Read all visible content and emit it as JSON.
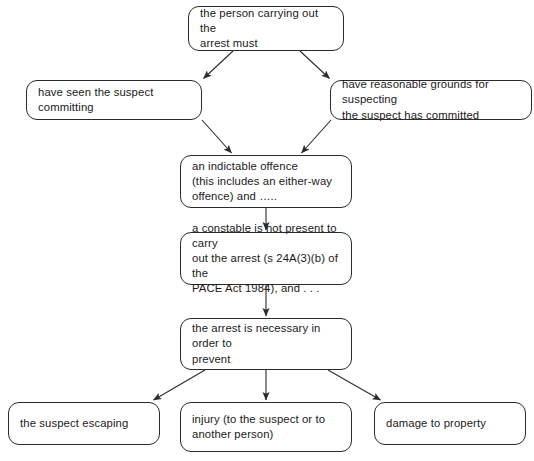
{
  "diagram": {
    "type": "flowchart",
    "background_color": "#ffffff",
    "line_color": "#2b2b2b",
    "text_color": "#1a1a1a",
    "nodes": [
      {
        "id": "person-carrying-out-arrest",
        "name": "node-person-carrying-out-arrest",
        "text": "the person carrying out the\narrest must",
        "x": 188,
        "y": 6,
        "width": 156,
        "height": 45
      },
      {
        "id": "have-seen-suspect-committing",
        "name": "node-have-seen-suspect-committing",
        "text": "have seen the suspect committing",
        "x": 26,
        "y": 80,
        "width": 176,
        "height": 40
      },
      {
        "id": "reasonable-grounds-suspecting",
        "name": "node-reasonable-grounds-suspecting",
        "text": "have reasonable grounds for suspecting\nthe suspect has committed",
        "x": 330,
        "y": 80,
        "width": 202,
        "height": 40
      },
      {
        "id": "indictable-offence",
        "name": "node-indictable-offence",
        "text": "an indictable offence\n(this includes an either-way\noffence) and …..",
        "x": 180,
        "y": 155,
        "width": 172,
        "height": 53
      },
      {
        "id": "constable-not-present",
        "name": "node-constable-not-present",
        "text": "a constable is not present to carry\nout the arrest (s 24A(3)(b) of the\nPACE Act 1984), and . . .",
        "x": 180,
        "y": 232,
        "width": 172,
        "height": 53
      },
      {
        "id": "arrest-necessary",
        "name": "node-arrest-necessary",
        "text": "the arrest is necessary in order to\nprevent",
        "x": 180,
        "y": 318,
        "width": 172,
        "height": 52
      },
      {
        "id": "suspect-escaping",
        "name": "node-suspect-escaping",
        "text": "the suspect escaping",
        "x": 8,
        "y": 402,
        "width": 152,
        "height": 43
      },
      {
        "id": "injury-to-suspect",
        "name": "node-injury-to-suspect",
        "text": "injury (to the suspect or to\nanother person)",
        "x": 180,
        "y": 402,
        "width": 172,
        "height": 50
      },
      {
        "id": "damage-to-property",
        "name": "node-damage-to-property",
        "text": "damage to property",
        "x": 374,
        "y": 402,
        "width": 152,
        "height": 43
      },
      {
        "id": "caption-diagram-title",
        "name": "diagram-title",
        "text": ""
      }
    ],
    "edges": [
      {
        "from": "person-carrying-out-arrest",
        "to": "have-seen-suspect-committing",
        "name": "edge-person-to-have-seen",
        "points": "233,51 202,80"
      },
      {
        "from": "person-carrying-out-arrest",
        "to": "reasonable-grounds-suspecting",
        "name": "edge-person-to-reasonable-grounds",
        "points": "300,51 331,80"
      },
      {
        "from": "have-seen-suspect-committing",
        "to": "indictable-offence",
        "name": "edge-have-seen-to-indictable",
        "points": "202,120 233,155"
      },
      {
        "from": "reasonable-grounds-suspecting",
        "to": "indictable-offence",
        "name": "edge-reasonable-grounds-to-indictable",
        "points": "331,120 300,155"
      },
      {
        "from": "indictable-offence",
        "to": "constable-not-present",
        "name": "edge-indictable-to-constable",
        "points": "266,208 266,232"
      },
      {
        "from": "constable-not-present",
        "to": "arrest-necessary",
        "name": "edge-constable-to-arrest-necessary",
        "points": "266,285 266,318"
      },
      {
        "from": "arrest-necessary",
        "to": "suspect-escaping",
        "name": "edge-arrest-necessary-to-escaping",
        "points": "205,370 152,402"
      },
      {
        "from": "arrest-necessary",
        "to": "injury-to-suspect",
        "name": "edge-arrest-necessary-to-injury",
        "points": "266,370 266,402"
      },
      {
        "from": "arrest-necessary",
        "to": "damage-to-property",
        "name": "edge-arrest-necessary-to-damage",
        "points": "328,370 382,402"
      }
    ]
  }
}
